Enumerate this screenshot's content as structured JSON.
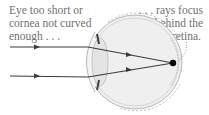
{
  "diagram": {
    "labels": {
      "cause": [
        "Eye too short or",
        "cornea not curved",
        "enough . . ."
      ],
      "effect": [
        ". . . rays focus",
        "behind the",
        "retina."
      ]
    },
    "rays": [
      {
        "start": [
          10,
          47
        ],
        "enter": [
          88,
          47
        ],
        "end": [
          173,
          63
        ]
      },
      {
        "start": [
          10,
          76
        ],
        "enter": [
          88,
          77
        ],
        "end": [
          173,
          63
        ]
      }
    ],
    "focal_point": [
      173,
      63
    ],
    "colors": {
      "ray": "#3a3a3a",
      "eye_fill": "#efefef",
      "eye_outline": "#a0a0a0",
      "text": "#707070",
      "focal_point": "#000000"
    }
  }
}
